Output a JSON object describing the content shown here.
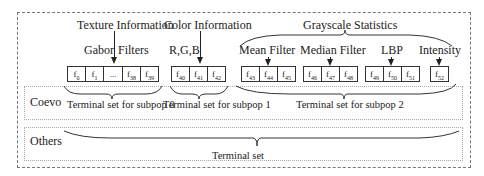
{
  "diagram": {
    "categories": {
      "texture": "Texture Information",
      "color": "Color Information",
      "grayscale": "Grayscale Statistics"
    },
    "groups": {
      "gabor_a": "Gabor",
      "gabor_b": "Filters",
      "rgb": "R,G,B",
      "mean": "Mean Filter",
      "median": "Median Filter",
      "lbp": "LBP",
      "intensity": "Intensity"
    },
    "features": {
      "f0": "f",
      "f0_sub": "0",
      "f1": "f",
      "f1_sub": "1",
      "dots": "...",
      "f38": "f",
      "f38_sub": "38",
      "f39": "f",
      "f39_sub": "39",
      "f40": "f",
      "f40_sub": "40",
      "f41": "f",
      "f41_sub": "41",
      "f42": "f",
      "f42_sub": "42",
      "f43": "f",
      "f43_sub": "43",
      "f44": "f",
      "f44_sub": "44",
      "f45": "f",
      "f45_sub": "45",
      "f46": "f",
      "f46_sub": "46",
      "f47": "f",
      "f47_sub": "47",
      "f48": "f",
      "f48_sub": "48",
      "f49": "f",
      "f49_sub": "49",
      "f50": "f",
      "f50_sub": "50",
      "f51": "f",
      "f51_sub": "51",
      "f52": "f",
      "f52_sub": "52"
    },
    "panels": {
      "coevo": {
        "label": "Coevo",
        "sets": [
          "Terminal set for subpop 0",
          "Terminal set for subpop 1",
          "Terminal set for subpop 2"
        ]
      },
      "others": {
        "label": "Others",
        "set": "Terminal set"
      }
    }
  }
}
